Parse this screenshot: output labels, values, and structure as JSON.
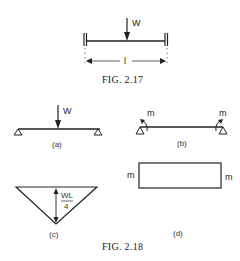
{
  "fig217": {
    "load_label": "W",
    "length_label": "l",
    "caption": "FIG. 2.17"
  },
  "fig218": {
    "caption": "FIG. 2.18",
    "a": {
      "load_label": "W",
      "sublabel": "(a)"
    },
    "b": {
      "moment_left": "m",
      "moment_right": "m",
      "sublabel": "(b)"
    },
    "c": {
      "value_num": "WL",
      "value_den": "4",
      "sublabel": "(c)"
    },
    "d": {
      "moment_left": "m",
      "moment_right": "m",
      "sublabel": "(d)"
    }
  }
}
